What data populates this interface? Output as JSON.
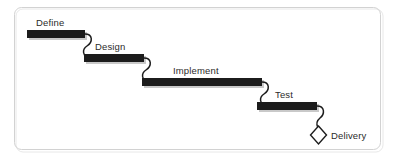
{
  "diagram": {
    "frame": {
      "x": 14,
      "y": 7,
      "width": 367,
      "height": 143,
      "radius": 7,
      "border_color": "#d2d2d2",
      "background_color": "#ffffff"
    },
    "colors": {
      "bar_fill": "#1c1c1c",
      "bar_shadow": "#c9c9c9",
      "connector_stroke": "#1c1c1c",
      "text": "#2b2b2b",
      "milestone_fill": "#ffffff",
      "milestone_stroke": "#1c1c1c"
    },
    "phases": [
      {
        "id": "define",
        "label": "Define",
        "bar": {
          "x": 27,
          "y": 30,
          "width": 58,
          "height": 8
        },
        "label_pos": {
          "x": 36,
          "y": 26
        }
      },
      {
        "id": "design",
        "label": "Design",
        "bar": {
          "x": 84,
          "y": 54,
          "width": 60,
          "height": 8
        },
        "label_pos": {
          "x": 95,
          "y": 50
        }
      },
      {
        "id": "implement",
        "label": "Implement",
        "bar": {
          "x": 142,
          "y": 78,
          "width": 120,
          "height": 8
        },
        "label_pos": {
          "x": 173,
          "y": 74
        }
      },
      {
        "id": "test",
        "label": "Test",
        "bar": {
          "x": 257,
          "y": 102,
          "width": 60,
          "height": 8
        },
        "label_pos": {
          "x": 275,
          "y": 98
        }
      }
    ],
    "connectors": [
      {
        "id": "define-to-design",
        "path": "M 85 34 C 93 34 93 42 87 46 C 81 50 84 56 87 58"
      },
      {
        "id": "design-to-implement",
        "path": "M 144 58 C 152 58 152 66 146 70 C 140 74 143 80 146 82"
      },
      {
        "id": "implement-to-test",
        "path": "M 262 82 C 270 82 270 90 264 94 C 258 98 261 104 264 106"
      },
      {
        "id": "test-to-delivery",
        "path": "M 317 106 C 325 106 325 114 320 118 C 315 122 317 126 318 128"
      }
    ],
    "milestone": {
      "id": "delivery",
      "label": "Delivery",
      "diamond": {
        "cx": 318.5,
        "cy": 135,
        "rx": 8,
        "ry": 9
      },
      "label_pos": {
        "x": 331,
        "y": 139
      }
    }
  }
}
